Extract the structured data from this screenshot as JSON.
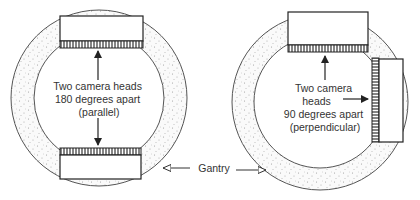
{
  "diagram": {
    "left": {
      "label_lines": [
        "Two camera heads",
        "180 degrees apart",
        "(parallel)"
      ],
      "configuration": "parallel"
    },
    "right": {
      "label_lines": [
        "Two camera",
        "heads",
        "90 degrees apart",
        "(perpendicular)"
      ],
      "configuration": "perpendicular"
    },
    "gantry_label": "Gantry",
    "colors": {
      "stroke": "#333333",
      "gantry_fill": "#f4f4f4",
      "stipple": "#9a9a9a",
      "background": "#ffffff"
    }
  }
}
